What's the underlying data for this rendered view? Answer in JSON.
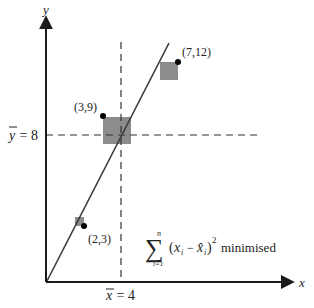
{
  "diagram": {
    "axes": {
      "x_label": "x",
      "y_label": "y"
    },
    "means": {
      "x_mean_label_var": "x",
      "x_mean_label_rest": " = 4",
      "x_mean_value": 4,
      "y_mean_label_var": "y",
      "y_mean_label_rest": " = 8",
      "y_mean_value": 8
    },
    "points": [
      {
        "label": "(2,3)",
        "x": 2,
        "y": 3
      },
      {
        "label": "(3,9)",
        "x": 3,
        "y": 9
      },
      {
        "label": "(7,12)",
        "x": 7,
        "y": 12
      }
    ],
    "formula": {
      "sum_upper": "n",
      "sum_lower": "i=1",
      "sum_symbol": "∑",
      "body_open": "(",
      "x_var": "x",
      "sub_i": "i",
      "minus": " − ",
      "xhat_var": "x̂",
      "close": ")",
      "power": "2",
      "caption": "minimised"
    },
    "colors": {
      "axis": "#1a1a1a",
      "line": "#3a3a3a",
      "square": "#8c8c8c",
      "dot": "#000000",
      "dashed": "#333333"
    }
  }
}
